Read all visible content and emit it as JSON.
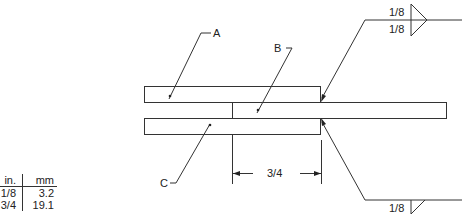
{
  "diagram": {
    "type": "lap-joint weld drawing",
    "labels": {
      "part_a": "A",
      "part_b": "B",
      "part_c": "C"
    },
    "dimension": {
      "overlap": "3/4"
    },
    "weld_symbols": {
      "top": {
        "arrow_side_size": "1/8",
        "other_side_size": "1/8",
        "type": "fillet-both-sides"
      },
      "bottom": {
        "size": "1/8",
        "type": "fillet"
      }
    },
    "conversion_table": {
      "headers": [
        "in.",
        "mm"
      ],
      "rows": [
        [
          "1/8",
          "3.2"
        ],
        [
          "3/4",
          "19.1"
        ]
      ]
    },
    "colors": {
      "line": "#333333",
      "background": "#ffffff"
    }
  }
}
